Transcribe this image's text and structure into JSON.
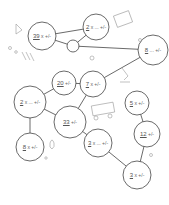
{
  "title": "",
  "nodes": [
    {
      "id": "n1",
      "cx": 42,
      "cy": 36,
      "r": 14,
      "value": "39",
      "expr": "x +/-"
    },
    {
      "id": "n2",
      "cx": 96,
      "cy": 27,
      "r": 13,
      "value": "2",
      "expr": "x ... +/-"
    },
    {
      "id": "n3",
      "cx": 73,
      "cy": 46,
      "r": 6,
      "value": "",
      "expr": ""
    },
    {
      "id": "n4",
      "cx": 153,
      "cy": 50,
      "r": 15,
      "value": "8",
      "expr": "... +/-"
    },
    {
      "id": "n5",
      "cx": 64,
      "cy": 83,
      "r": 12,
      "value": "20",
      "expr": "+/-"
    },
    {
      "id": "n6",
      "cx": 93,
      "cy": 84,
      "r": 13,
      "value": "7",
      "expr": "x +/-"
    },
    {
      "id": "n7",
      "cx": 30,
      "cy": 102,
      "r": 16,
      "value": "2",
      "expr": "x ... +/-"
    },
    {
      "id": "n8",
      "cx": 70,
      "cy": 122,
      "r": 16,
      "value": "33",
      "expr": "+/-"
    },
    {
      "id": "n9",
      "cx": 137,
      "cy": 103,
      "r": 12,
      "value": "5",
      "expr": "x +/-"
    },
    {
      "id": "n10",
      "cx": 30,
      "cy": 147,
      "r": 14,
      "value": "8",
      "expr": "x +/-"
    },
    {
      "id": "n11",
      "cx": 98,
      "cy": 143,
      "r": 14,
      "value": "3",
      "expr": "x ... +/-"
    },
    {
      "id": "n12",
      "cx": 147,
      "cy": 134,
      "r": 13,
      "value": "12",
      "expr": "+/-"
    },
    {
      "id": "n13",
      "cx": 137,
      "cy": 175,
      "r": 14,
      "value": "3",
      "expr": "x +/-"
    }
  ],
  "edges": [
    [
      "n1",
      "n2"
    ],
    [
      "n1",
      "n3"
    ],
    [
      "n3",
      "n2"
    ],
    [
      "n3",
      "n4"
    ],
    [
      "n4",
      "n6"
    ],
    [
      "n5",
      "n6"
    ],
    [
      "n5",
      "n7"
    ],
    [
      "n7",
      "n8"
    ],
    [
      "n7",
      "n10"
    ],
    [
      "n8",
      "n11"
    ],
    [
      "n8",
      "n6"
    ],
    [
      "n9",
      "n12"
    ],
    [
      "n11",
      "n13"
    ],
    [
      "n12",
      "n13"
    ]
  ],
  "decorations": [
    "test-tube-icon",
    "chemistry-flask-icon",
    "calculator-icon",
    "microscope-icon",
    "bus-icon",
    "hand-icon",
    "triangle-icon",
    "bubbles"
  ]
}
